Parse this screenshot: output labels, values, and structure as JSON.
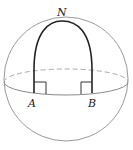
{
  "diagram": {
    "type": "sphere-geodesic-triangle",
    "labels": {
      "north_pole": "N",
      "point_a": "A",
      "point_b": "B"
    },
    "colors": {
      "sphere_outline": "#9a9a9a",
      "equator": "#8a8a8a",
      "geodesic_arcs": "#222222",
      "right_angle_marks": "#333333"
    },
    "annotations": {
      "angle_at_a": "right angle",
      "angle_at_b": "right angle"
    }
  }
}
